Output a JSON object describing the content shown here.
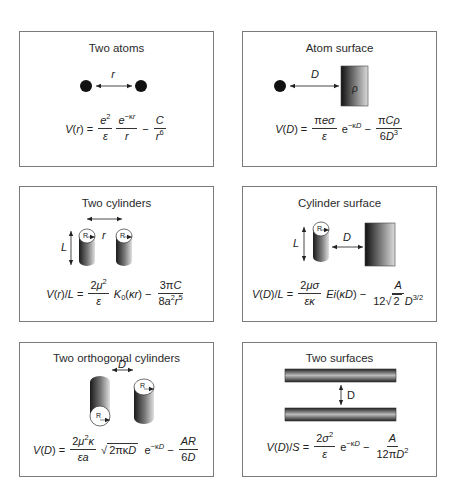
{
  "figure": {
    "panels": [
      {
        "id": "two-atoms",
        "title": "Two atoms",
        "distance_label": "r",
        "equation": {
          "lhs": "V(r)",
          "term1_num": "e²",
          "term1_den": "ε",
          "term2_num": "e^(−κr)",
          "term2_den": "r",
          "term3_num": "C",
          "term3_den": "r⁶",
          "text": "V(r) = (e²/ε)(e^(−κr)/r) − C/r⁶"
        }
      },
      {
        "id": "atom-surface",
        "title": "Atom surface",
        "distance_label": "D",
        "surface_label": "ρ",
        "equation": {
          "lhs": "V(D)",
          "term1_num": "πeσ",
          "term1_den": "ε",
          "exp": "e^(−κD)",
          "term3_num": "πCρ",
          "term3_den": "6D³",
          "text": "V(D) = (πeσ/ε) e^(−κD) − πCρ/(6D³)"
        }
      },
      {
        "id": "two-cylinders",
        "title": "Two cylinders",
        "length_label": "L",
        "radius_label": "R",
        "distance_label": "r",
        "equation": {
          "lhs": "V(r)/L",
          "term1_num": "2μ²",
          "term1_den": "ε",
          "bessel": "K₀(κr)",
          "term3_num": "3πC",
          "term3_den": "8a²r⁵",
          "text": "V(r)/L = (2μ²/ε) K₀(κr) − 3πC/(8a²r⁵)"
        }
      },
      {
        "id": "cylinder-surface",
        "title": "Cylinder surface",
        "length_label": "L",
        "radius_label": "R",
        "distance_label": "D",
        "equation": {
          "lhs": "V(D)/L",
          "term1_num": "2μσ",
          "term1_den": "εκ",
          "ei": "Ei(κD)",
          "term3_num": "A",
          "term3_den": "12√2 D^(3/2)",
          "text": "V(D)/L = (2μσ/εκ) Ei(κD) − A/(12√2 D^(3/2))"
        }
      },
      {
        "id": "two-orthogonal-cylinders",
        "title": "Two orthogonal cylinders",
        "radius_label": "R",
        "distance_label": "D",
        "equation": {
          "lhs": "V(D)",
          "term1_num": "2μ²κ",
          "term1_den": "εa",
          "sqrt": "2πκD",
          "exp": "e^(−κD)",
          "term3_num": "AR",
          "term3_den": "6D",
          "text": "V(D) = (2μ²κ/εa) √(2πκD) e^(−κD) − AR/(6D)"
        }
      },
      {
        "id": "two-surfaces",
        "title": "Two surfaces",
        "distance_label": "D",
        "equation": {
          "lhs": "V(D)/S",
          "term1_num": "2σ²",
          "term1_den": "ε",
          "exp": "e^(−κD)",
          "term3_num": "A",
          "term3_den": "12πD²",
          "text": "V(D)/S = (2σ²/ε) e^(−κD) − A/(12πD²)"
        }
      }
    ]
  }
}
